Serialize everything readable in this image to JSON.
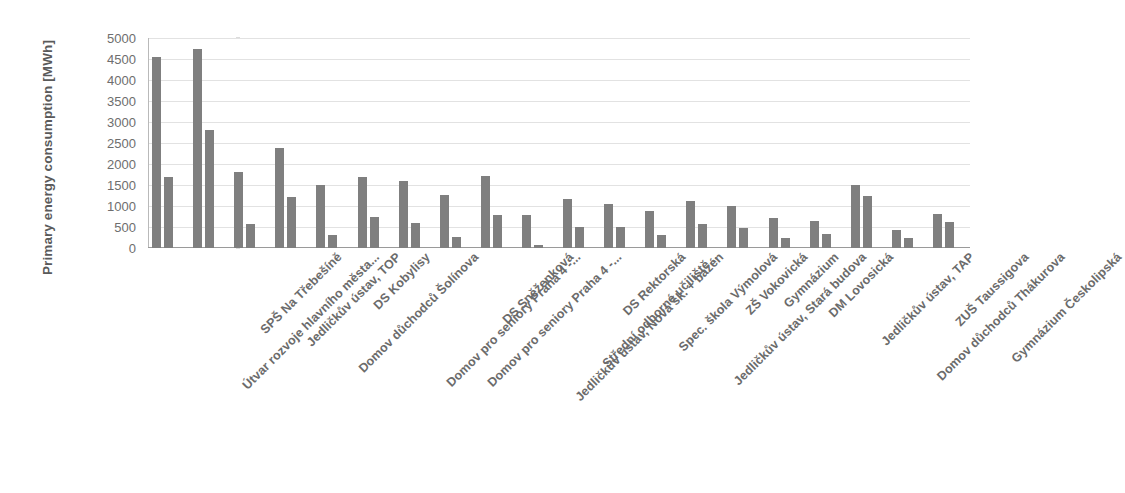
{
  "chart_data": {
    "type": "bar",
    "title": "",
    "xlabel": "",
    "ylabel": "Primary energy consumption [MWh]",
    "ylim": [
      0,
      5000
    ],
    "ytick_step": 500,
    "yticks": [
      "5000",
      "4500",
      "4000",
      "3500",
      "3000",
      "2500",
      "2000",
      "1500",
      "1000",
      "500",
      "0"
    ],
    "grid": true,
    "legend": "none",
    "bar_color": "#7f7f7f",
    "categories": [
      "Útvar rozvoje hlavního města...",
      "SPŠ Na Třebešíně",
      "Jedličkův ústav, TOP",
      "Domov důchodců Šolínova",
      "DS Kobylisy",
      "Domov pro seniory Praha 4 -...",
      "Domov pro seniory Praha 4 -...",
      "DS Sněženková",
      "Jedličkův ústav, Nová šk. + bazén",
      "Střední odborné učiliště...",
      "DS Rektorská",
      "Spec. škola Výmolová",
      "Jedličkův ústav, Stará budova",
      "ZŠ Vokovická",
      "Gymnázium",
      "DM Lovosická",
      "Jedličkův ústav, TAP",
      "Domov důchodců Thákurova",
      "ZUŠ Taussigova",
      "Gymnázium Českolipská"
    ],
    "series": [
      {
        "name": "before",
        "values": [
          4550,
          4750,
          1820,
          2380,
          1500,
          1700,
          1590,
          1270,
          1720,
          790,
          1160,
          1050,
          880,
          1110,
          1000,
          720,
          650,
          1500,
          430,
          820
        ]
      },
      {
        "name": "after",
        "values": [
          1700,
          2800,
          560,
          1220,
          320,
          730,
          590,
          270,
          790,
          60,
          510,
          490,
          310,
          560,
          480,
          250,
          340,
          1230,
          250,
          620
        ]
      }
    ]
  }
}
